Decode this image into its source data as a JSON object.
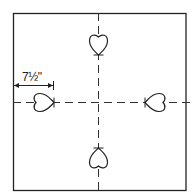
{
  "diagram": {
    "dimension_label": "7½\"",
    "stroke_color": "#222222",
    "background": "#ffffff",
    "hearts": [
      {
        "position": "top",
        "orientation": "tip-down"
      },
      {
        "position": "bottom",
        "orientation": "tip-up"
      },
      {
        "position": "left",
        "orientation": "tip-right"
      },
      {
        "position": "right",
        "orientation": "tip-left"
      }
    ]
  }
}
